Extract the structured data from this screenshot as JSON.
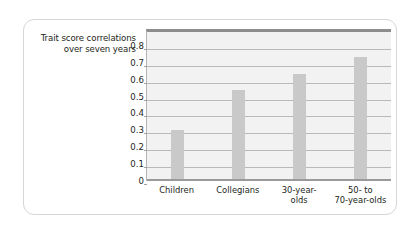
{
  "chart_data": {
    "type": "bar",
    "title": "",
    "xlabel": "",
    "ylabel": "Trait score correlations over seven years",
    "categories": [
      "Children",
      "Collegians",
      "30-year-olds",
      "50- to 70-year-olds"
    ],
    "category_display": [
      "Children",
      "Collegians",
      "30-year-\nolds",
      "50-  to\n70-year-olds"
    ],
    "values": [
      0.305,
      0.54,
      0.635,
      0.735
    ],
    "ylim": [
      0,
      0.9
    ],
    "ytick_values": [
      0.8,
      0.7,
      0.6,
      0.5,
      0.4,
      0.3,
      0.2,
      0.1,
      0
    ],
    "ytick_labels": [
      "0.8",
      "0.7",
      "0.6",
      "0.5",
      "0.4",
      "0.3",
      "0.2",
      "0.1",
      "0"
    ],
    "grid": true,
    "legend": "none",
    "bar_color": "#c9c9c9",
    "plot_background": "#f2f2f2",
    "gridline_color": "#b9b9b9",
    "axis_color": "#8d8d8d",
    "text_color": "#231f20",
    "card_border_color": "#d6d6d6",
    "page_background": "#ffffff"
  }
}
